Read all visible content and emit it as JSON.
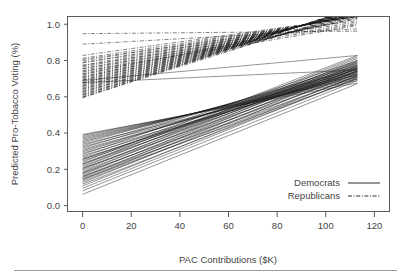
{
  "chart_data": {
    "type": "line",
    "title": "",
    "xlabel": "PAC Contributions ($K)",
    "ylabel": "Predicted Pro-Tobacco Voting (%)",
    "xlim": [
      -6,
      126
    ],
    "ylim": [
      -0.03,
      1.04
    ],
    "xticks": [
      0,
      20,
      40,
      60,
      80,
      100,
      120
    ],
    "xtick_labels": [
      "0",
      "20",
      "40",
      "60",
      "80",
      "100",
      "120"
    ],
    "yticks": [
      0.0,
      0.2,
      0.4,
      0.6,
      0.8,
      1.0
    ],
    "ytick_labels": [
      "0.0",
      "0.2",
      "0.4",
      "0.6",
      "0.8",
      "1.0"
    ],
    "grid": false,
    "legend_position": "bottom-right",
    "legend": [
      {
        "name": "Democrats",
        "linestyle": "solid",
        "color": "#1a1a1a"
      },
      {
        "name": "Republicans",
        "linestyle": "dashdot",
        "color": "#1a1a1a"
      }
    ],
    "series": [
      {
        "name": "Democrats",
        "linestyle": "solid",
        "x_start": 0,
        "x_end": 113,
        "y_start_range": [
          0.06,
          0.39
        ],
        "y_end_range": [
          0.66,
          0.84
        ],
        "lines": [
          {
            "y0": 0.062,
            "y1": 0.672
          },
          {
            "y0": 0.081,
            "y1": 0.69
          },
          {
            "y0": 0.095,
            "y1": 0.706
          },
          {
            "y0": 0.108,
            "y1": 0.718
          },
          {
            "y0": 0.118,
            "y1": 0.7
          },
          {
            "y0": 0.126,
            "y1": 0.742
          },
          {
            "y0": 0.134,
            "y1": 0.716
          },
          {
            "y0": 0.141,
            "y1": 0.758
          },
          {
            "y0": 0.149,
            "y1": 0.73
          },
          {
            "y0": 0.155,
            "y1": 0.77
          },
          {
            "y0": 0.162,
            "y1": 0.745
          },
          {
            "y0": 0.169,
            "y1": 0.782
          },
          {
            "y0": 0.176,
            "y1": 0.756
          },
          {
            "y0": 0.183,
            "y1": 0.793
          },
          {
            "y0": 0.19,
            "y1": 0.768
          },
          {
            "y0": 0.197,
            "y1": 0.802
          },
          {
            "y0": 0.204,
            "y1": 0.777
          },
          {
            "y0": 0.211,
            "y1": 0.812
          },
          {
            "y0": 0.218,
            "y1": 0.786
          },
          {
            "y0": 0.225,
            "y1": 0.82
          },
          {
            "y0": 0.232,
            "y1": 0.795
          },
          {
            "y0": 0.24,
            "y1": 0.828
          },
          {
            "y0": 0.247,
            "y1": 0.756
          },
          {
            "y0": 0.254,
            "y1": 0.772
          },
          {
            "y0": 0.261,
            "y1": 0.742
          },
          {
            "y0": 0.268,
            "y1": 0.788
          },
          {
            "y0": 0.275,
            "y1": 0.735
          },
          {
            "y0": 0.282,
            "y1": 0.8
          },
          {
            "y0": 0.289,
            "y1": 0.726
          },
          {
            "y0": 0.296,
            "y1": 0.76
          },
          {
            "y0": 0.303,
            "y1": 0.748
          },
          {
            "y0": 0.31,
            "y1": 0.735
          },
          {
            "y0": 0.317,
            "y1": 0.775
          },
          {
            "y0": 0.324,
            "y1": 0.722
          },
          {
            "y0": 0.331,
            "y1": 0.762
          },
          {
            "y0": 0.338,
            "y1": 0.712
          },
          {
            "y0": 0.345,
            "y1": 0.752
          },
          {
            "y0": 0.352,
            "y1": 0.74
          },
          {
            "y0": 0.359,
            "y1": 0.728
          },
          {
            "y0": 0.366,
            "y1": 0.718
          },
          {
            "y0": 0.373,
            "y1": 0.706
          },
          {
            "y0": 0.38,
            "y1": 0.698
          },
          {
            "y0": 0.387,
            "y1": 0.688
          },
          {
            "y0": 0.392,
            "y1": 0.676
          },
          {
            "y0": 0.205,
            "y1": 0.74
          },
          {
            "y0": 0.23,
            "y1": 0.752
          },
          {
            "y0": 0.255,
            "y1": 0.764
          },
          {
            "y0": 0.18,
            "y1": 0.726
          },
          {
            "y0": 0.16,
            "y1": 0.712
          },
          {
            "y0": 0.145,
            "y1": 0.698
          },
          {
            "y0": 0.69,
            "y1": 0.828
          },
          {
            "y0": 0.678,
            "y1": 0.748
          }
        ]
      },
      {
        "name": "Republicans",
        "linestyle": "dashdot",
        "x_start": 0,
        "x_end": 113,
        "y_start_range": [
          0.59,
          0.95
        ],
        "y_end_range": [
          0.93,
          1.04
        ],
        "lines": [
          {
            "y0": 0.948,
            "y1": 0.962
          },
          {
            "y0": 0.89,
            "y1": 0.975
          },
          {
            "y0": 0.828,
            "y1": 1.04
          },
          {
            "y0": 0.812,
            "y1": 1.042
          },
          {
            "y0": 0.798,
            "y1": 1.045
          },
          {
            "y0": 0.786,
            "y1": 1.046
          },
          {
            "y0": 0.774,
            "y1": 1.048
          },
          {
            "y0": 0.764,
            "y1": 1.05
          },
          {
            "y0": 0.754,
            "y1": 1.052
          },
          {
            "y0": 0.745,
            "y1": 1.054
          },
          {
            "y0": 0.736,
            "y1": 1.056
          },
          {
            "y0": 0.728,
            "y1": 1.058
          },
          {
            "y0": 0.72,
            "y1": 1.06
          },
          {
            "y0": 0.712,
            "y1": 1.062
          },
          {
            "y0": 0.705,
            "y1": 1.064
          },
          {
            "y0": 0.698,
            "y1": 1.066
          },
          {
            "y0": 0.691,
            "y1": 1.068
          },
          {
            "y0": 0.684,
            "y1": 1.07
          },
          {
            "y0": 0.677,
            "y1": 1.072
          },
          {
            "y0": 0.67,
            "y1": 1.074
          },
          {
            "y0": 0.663,
            "y1": 1.076
          },
          {
            "y0": 0.656,
            "y1": 1.078
          },
          {
            "y0": 0.649,
            "y1": 1.08
          },
          {
            "y0": 0.642,
            "y1": 1.082
          },
          {
            "y0": 0.635,
            "y1": 1.084
          },
          {
            "y0": 0.628,
            "y1": 1.086
          },
          {
            "y0": 0.621,
            "y1": 1.088
          },
          {
            "y0": 0.614,
            "y1": 1.09
          },
          {
            "y0": 0.607,
            "y1": 1.092
          },
          {
            "y0": 0.6,
            "y1": 1.094
          },
          {
            "y0": 0.594,
            "y1": 1.096
          },
          {
            "y0": 0.806,
            "y1": 1.02
          },
          {
            "y0": 0.79,
            "y1": 1.012
          },
          {
            "y0": 0.772,
            "y1": 1.004
          },
          {
            "y0": 0.756,
            "y1": 0.998
          },
          {
            "y0": 0.74,
            "y1": 0.992
          },
          {
            "y0": 0.724,
            "y1": 1.03
          },
          {
            "y0": 0.708,
            "y1": 1.034
          },
          {
            "y0": 0.692,
            "y1": 1.038
          },
          {
            "y0": 0.676,
            "y1": 1.044
          },
          {
            "y0": 0.66,
            "y1": 1.05
          },
          {
            "y0": 0.644,
            "y1": 1.056
          },
          {
            "y0": 0.628,
            "y1": 1.062
          },
          {
            "y0": 0.612,
            "y1": 1.068
          },
          {
            "y0": 0.598,
            "y1": 1.074
          }
        ]
      }
    ]
  },
  "footer": {
    "rule": true
  }
}
